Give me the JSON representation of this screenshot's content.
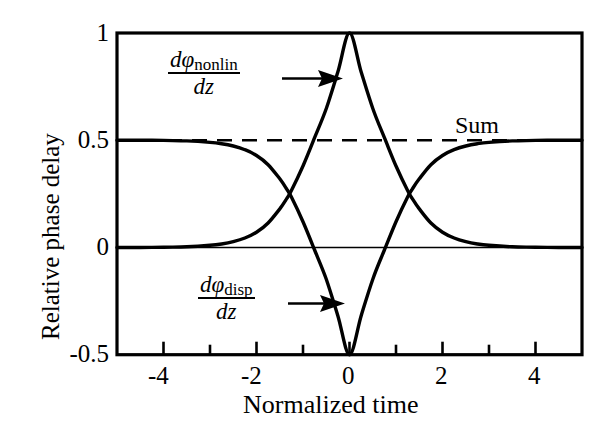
{
  "figure": {
    "background_color": "#ffffff",
    "line_color": "#000000",
    "axis_color": "#000000"
  },
  "axes": {
    "xlabel": "Normalized time",
    "ylabel": "Relative phase delay",
    "xlim": [
      -5,
      5
    ],
    "ylim": [
      -0.5,
      1
    ],
    "x_tick_labels": [
      "-4",
      "-2",
      "0",
      "2",
      "4"
    ],
    "x_tick_values": [
      -4,
      -2,
      0,
      2,
      4
    ],
    "x_minor_tick_values": [
      -5,
      -3,
      -1,
      1,
      3,
      5
    ],
    "y_tick_labels": [
      "1",
      "0.5",
      "0",
      "-0.5"
    ],
    "y_tick_values": [
      1,
      0.5,
      0,
      -0.5
    ],
    "grid": false,
    "frame": "box"
  },
  "annotations": {
    "nonlin": {
      "numerator_d": "d",
      "numerator_phi": "φ",
      "numerator_sub": "nonlin",
      "denominator": "dz",
      "arrow": "arrow-right"
    },
    "disp": {
      "numerator_d": "d",
      "numerator_phi": "φ",
      "numerator_sub": "disp",
      "denominator": "dz",
      "arrow": "arrow-right"
    },
    "sum_label": "Sum"
  },
  "chart_data": {
    "type": "line",
    "title": "",
    "xlabel": "Normalized time",
    "ylabel": "Relative phase delay",
    "xlim": [
      -5,
      5
    ],
    "ylim": [
      -0.5,
      1
    ],
    "grid": false,
    "legend": "inline-annotations",
    "series": [
      {
        "name": "dφ_nonlin/dz",
        "style": "solid",
        "description": "Nonlinear phase delay: sech-squared pulse rising from 0 baseline to peak 1 at t=0",
        "x": [
          -5,
          -4.5,
          -4,
          -3.5,
          -3,
          -2.75,
          -2.5,
          -2.25,
          -2,
          -1.75,
          -1.5,
          -1.35,
          -1.25,
          -1,
          -0.75,
          -0.5,
          -0.25,
          0,
          0.25,
          0.5,
          0.75,
          1,
          1.25,
          1.35,
          1.5,
          1.75,
          2,
          2.25,
          2.5,
          2.75,
          3,
          3.5,
          4,
          4.5,
          5
        ],
        "y": [
          0.0,
          0.0,
          0.001,
          0.003,
          0.01,
          0.016,
          0.027,
          0.044,
          0.071,
          0.114,
          0.18,
          0.228,
          0.265,
          0.38,
          0.512,
          0.648,
          0.819,
          1.0,
          0.819,
          0.648,
          0.512,
          0.38,
          0.265,
          0.228,
          0.18,
          0.114,
          0.071,
          0.044,
          0.027,
          0.016,
          0.01,
          0.003,
          0.001,
          0.0,
          0.0
        ]
      },
      {
        "name": "dφ_disp/dz",
        "style": "solid",
        "description": "Dispersive phase delay: inverted pulse falling from 0.5 baseline to -0.5 at t=0; exactly 0.5 minus the nonlinear curve",
        "x": [
          -5,
          -4.5,
          -4,
          -3.5,
          -3,
          -2.75,
          -2.5,
          -2.25,
          -2,
          -1.75,
          -1.5,
          -1.35,
          -1.25,
          -1,
          -0.75,
          -0.5,
          -0.25,
          0,
          0.25,
          0.5,
          0.75,
          1,
          1.25,
          1.35,
          1.5,
          1.75,
          2,
          2.25,
          2.5,
          2.75,
          3,
          3.5,
          4,
          4.5,
          5
        ],
        "y": [
          0.5,
          0.5,
          0.499,
          0.497,
          0.49,
          0.484,
          0.473,
          0.456,
          0.429,
          0.386,
          0.32,
          0.272,
          0.235,
          0.12,
          -0.012,
          -0.148,
          -0.319,
          -0.5,
          -0.319,
          -0.148,
          -0.012,
          0.12,
          0.235,
          0.272,
          0.32,
          0.386,
          0.429,
          0.456,
          0.473,
          0.484,
          0.49,
          0.497,
          0.499,
          0.5,
          0.5
        ]
      },
      {
        "name": "Sum",
        "style": "dashed",
        "description": "Sum of the two curves, constant at 0.5 across the full range",
        "x": [
          -5,
          5
        ],
        "y": [
          0.5,
          0.5
        ]
      }
    ],
    "reference_lines": [
      {
        "name": "zero-line",
        "axis": "y",
        "value": 0,
        "style": "thin-solid"
      }
    ]
  }
}
